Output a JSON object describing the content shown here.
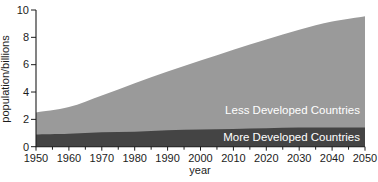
{
  "figure": {
    "background": "#ffffff",
    "width": 378,
    "height": 182
  },
  "chart_data": {
    "type": "area",
    "stacked": true,
    "title": "",
    "xlabel": "year",
    "ylabel": "population/billions",
    "xlim": [
      1950,
      2050
    ],
    "ylim": [
      0,
      10
    ],
    "grid": false,
    "legend": "inline-area-labels",
    "axis_color": "#1c1c1c",
    "x": [
      1950,
      1960,
      1970,
      1980,
      1990,
      2000,
      2010,
      2020,
      2030,
      2040,
      2050
    ],
    "series": [
      {
        "name": "More Developed Countries",
        "color": "#444444",
        "label_color": "#ffffff",
        "values": [
          0.9,
          0.95,
          1.05,
          1.1,
          1.2,
          1.25,
          1.3,
          1.35,
          1.4,
          1.4,
          1.4
        ]
      },
      {
        "name": "Less Developed Countries",
        "color": "#9a9a9a",
        "label_color": "#ffffff",
        "values": [
          1.6,
          1.95,
          2.7,
          3.55,
          4.3,
          5.05,
          5.8,
          6.5,
          7.15,
          7.75,
          8.15
        ]
      }
    ],
    "stacked_totals": [
      2.5,
      2.9,
      3.75,
      4.65,
      5.5,
      6.3,
      7.1,
      7.85,
      8.55,
      9.15,
      9.55
    ],
    "x_major_ticks": [
      1950,
      1960,
      1970,
      1980,
      1990,
      2000,
      2010,
      2020,
      2030,
      2040,
      2050
    ],
    "x_tick_labels": [
      "1950",
      "1960",
      "1970",
      "1980",
      "1990",
      "2000",
      "2010",
      "2020",
      "2030",
      "2040",
      "2050"
    ],
    "x_minor_ticks": [
      1955,
      1965,
      1975,
      1985,
      1995,
      2005,
      2015,
      2025,
      2035,
      2045
    ],
    "y_major_ticks": [
      0,
      2,
      4,
      6,
      8,
      10
    ],
    "y_tick_labels": [
      "0",
      "2",
      "4",
      "6",
      "8",
      "10"
    ]
  }
}
